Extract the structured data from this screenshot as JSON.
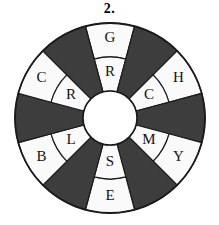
{
  "figure": {
    "label": "2.",
    "type": "segmented-color-wheel",
    "background_color": "#ffffff",
    "outline_color": "#1a1a1a",
    "dark_sector_color": "#3d3d3d",
    "light_sector_color": "#fafafa",
    "hub_color": "#ffffff",
    "letter_color": "#111111"
  },
  "wheel": {
    "center_x": 110,
    "center_y": 118,
    "outer_radius": 95,
    "middle_radius": 61,
    "hub_radius": 27,
    "sector_count": 12,
    "sector_degrees": 30,
    "sectors": [
      {
        "index": 0,
        "start_angle": -15,
        "end_angle": 15,
        "fill": "light",
        "outer_letter": "G",
        "inner_letter": "R"
      },
      {
        "index": 1,
        "start_angle": 15,
        "end_angle": 45,
        "fill": "dark",
        "outer_letter": "",
        "inner_letter": ""
      },
      {
        "index": 2,
        "start_angle": 45,
        "end_angle": 75,
        "fill": "light",
        "outer_letter": "H",
        "inner_letter": "C"
      },
      {
        "index": 3,
        "start_angle": 75,
        "end_angle": 105,
        "fill": "dark",
        "outer_letter": "",
        "inner_letter": ""
      },
      {
        "index": 4,
        "start_angle": 105,
        "end_angle": 135,
        "fill": "light",
        "outer_letter": "Y",
        "inner_letter": "M"
      },
      {
        "index": 5,
        "start_angle": 135,
        "end_angle": 165,
        "fill": "dark",
        "outer_letter": "",
        "inner_letter": ""
      },
      {
        "index": 6,
        "start_angle": 165,
        "end_angle": 195,
        "fill": "light",
        "outer_letter": "E",
        "inner_letter": "S"
      },
      {
        "index": 7,
        "start_angle": 195,
        "end_angle": 225,
        "fill": "dark",
        "outer_letter": "",
        "inner_letter": ""
      },
      {
        "index": 8,
        "start_angle": 225,
        "end_angle": 255,
        "fill": "light",
        "outer_letter": "B",
        "inner_letter": "L"
      },
      {
        "index": 9,
        "start_angle": 255,
        "end_angle": 285,
        "fill": "dark",
        "outer_letter": "",
        "inner_letter": ""
      },
      {
        "index": 10,
        "start_angle": 285,
        "end_angle": 315,
        "fill": "light",
        "outer_letter": "C",
        "inner_letter": "R"
      },
      {
        "index": 11,
        "start_angle": 315,
        "end_angle": 345,
        "fill": "dark",
        "outer_letter": "",
        "inner_letter": ""
      }
    ],
    "outer_letters": [
      "G",
      "H",
      "Y",
      "E",
      "B",
      "C"
    ],
    "inner_letters": [
      "R",
      "C",
      "M",
      "S",
      "L",
      "R"
    ]
  }
}
